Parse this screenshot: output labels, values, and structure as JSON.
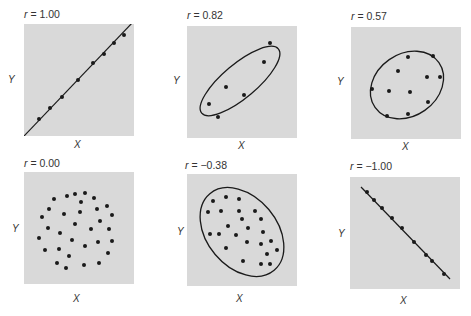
{
  "chart_data": [
    {
      "type": "scatter",
      "title": "r = 1.00",
      "r": "1.00",
      "xlabel": "X",
      "ylabel": "Y",
      "grid": false,
      "fit": "line",
      "line": [
        [
          0,
          112
        ],
        [
          110,
          -3
        ]
      ],
      "points": [
        [
          15,
          95
        ],
        [
          26,
          84
        ],
        [
          38,
          73
        ],
        [
          54,
          56
        ],
        [
          69,
          39
        ],
        [
          80,
          30
        ],
        [
          90,
          19
        ],
        [
          100,
          11
        ]
      ]
    },
    {
      "type": "scatter",
      "title": "r = 0.82",
      "r": "0.82",
      "xlabel": "X",
      "ylabel": "Y",
      "grid": false,
      "fit": "ellipse",
      "ellipse": {
        "cx": 53,
        "cy": 55,
        "rx": 50,
        "ry": 17,
        "rotate": -40
      },
      "points": [
        [
          22,
          78
        ],
        [
          31,
          91
        ],
        [
          39,
          61
        ],
        [
          57,
          69
        ],
        [
          77,
          36
        ],
        [
          83,
          17
        ]
      ]
    },
    {
      "type": "scatter",
      "title": "r = 0.57",
      "r": "0.57",
      "xlabel": "X",
      "ylabel": "Y",
      "grid": false,
      "fit": "ellipse",
      "ellipse": {
        "cx": 56,
        "cy": 58,
        "rx": 39,
        "ry": 31,
        "rotate": -35
      },
      "points": [
        [
          57,
          30
        ],
        [
          82,
          29
        ],
        [
          47,
          44
        ],
        [
          76,
          50
        ],
        [
          89,
          50
        ],
        [
          21,
          62
        ],
        [
          38,
          64
        ],
        [
          59,
          65
        ],
        [
          77,
          75
        ],
        [
          57,
          87
        ],
        [
          36,
          89
        ]
      ]
    },
    {
      "type": "scatter",
      "title": "r = 0.00",
      "r": "0.00",
      "xlabel": "X",
      "ylabel": "Y",
      "grid": false,
      "fit": "none",
      "points": [
        [
          43,
          24
        ],
        [
          51,
          22
        ],
        [
          61,
          21
        ],
        [
          30,
          27
        ],
        [
          57,
          30
        ],
        [
          70,
          26
        ],
        [
          25,
          37
        ],
        [
          40,
          42
        ],
        [
          56,
          40
        ],
        [
          73,
          37
        ],
        [
          83,
          34
        ],
        [
          18,
          45
        ],
        [
          88,
          43
        ],
        [
          51,
          52
        ],
        [
          76,
          49
        ],
        [
          24,
          56
        ],
        [
          67,
          57
        ],
        [
          85,
          57
        ],
        [
          36,
          61
        ],
        [
          15,
          66
        ],
        [
          48,
          68
        ],
        [
          74,
          70
        ],
        [
          88,
          69
        ],
        [
          61,
          74
        ],
        [
          21,
          78
        ],
        [
          35,
          77
        ],
        [
          45,
          84
        ],
        [
          84,
          81
        ],
        [
          33,
          91
        ],
        [
          42,
          96
        ],
        [
          60,
          93
        ],
        [
          75,
          91
        ]
      ]
    },
    {
      "type": "scatter",
      "title": "r = −0.38",
      "r": "−0.38",
      "xlabel": "X",
      "ylabel": "Y",
      "grid": false,
      "fit": "ellipse",
      "ellipse": {
        "cx": 55,
        "cy": 58,
        "rx": 50,
        "ry": 35,
        "rotate": 50
      },
      "points": [
        [
          26,
          27
        ],
        [
          39,
          23
        ],
        [
          52,
          25
        ],
        [
          21,
          38
        ],
        [
          34,
          37
        ],
        [
          52,
          37
        ],
        [
          68,
          37
        ],
        [
          55,
          45
        ],
        [
          74,
          45
        ],
        [
          41,
          52
        ],
        [
          61,
          54
        ],
        [
          23,
          60
        ],
        [
          32,
          60
        ],
        [
          49,
          61
        ],
        [
          76,
          58
        ],
        [
          60,
          68
        ],
        [
          74,
          70
        ],
        [
          84,
          67
        ],
        [
          39,
          74
        ],
        [
          90,
          76
        ],
        [
          80,
          80
        ],
        [
          56,
          87
        ],
        [
          74,
          90
        ],
        [
          83,
          90
        ]
      ]
    },
    {
      "type": "scatter",
      "title": "r = −1.00",
      "r": "−1.00",
      "xlabel": "X",
      "ylabel": "Y",
      "grid": false,
      "fit": "line",
      "line": [
        [
          11,
          10
        ],
        [
          100,
          102
        ]
      ],
      "points": [
        [
          17,
          15
        ],
        [
          24,
          23
        ],
        [
          32,
          31
        ],
        [
          42,
          41
        ],
        [
          52,
          51
        ],
        [
          64,
          65
        ],
        [
          76,
          78
        ],
        [
          82,
          84
        ],
        [
          94,
          97
        ]
      ]
    }
  ],
  "style": {
    "panel_bg": "#d9d9d9",
    "ink": "#1a1a1a"
  },
  "panels": [
    {
      "r_prefix": "r = ",
      "r_value": "1.00",
      "x": "X",
      "y": "Y"
    },
    {
      "r_prefix": "r = ",
      "r_value": "0.82",
      "x": "X",
      "y": "Y"
    },
    {
      "r_prefix": "r = ",
      "r_value": "0.57",
      "x": "X",
      "y": "Y"
    },
    {
      "r_prefix": "r = ",
      "r_value": "0.00",
      "x": "X",
      "y": "Y"
    },
    {
      "r_prefix": "r = ",
      "r_value": "−0.38",
      "x": "X",
      "y": "Y"
    },
    {
      "r_prefix": "r = ",
      "r_value": "−1.00",
      "x": "X",
      "y": "Y"
    }
  ]
}
